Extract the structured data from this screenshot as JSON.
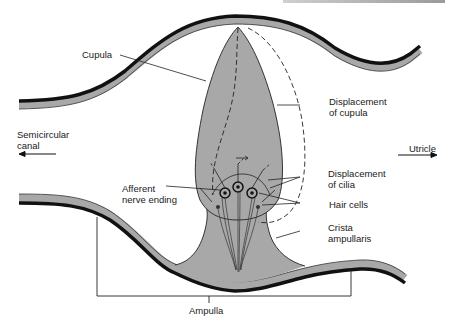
{
  "diagram": {
    "type": "anatomical-cross-section",
    "colors": {
      "tissue_fill": "#a8a8a8",
      "wall_dark": "#111111",
      "wall_light": "#a8a8a8",
      "line": "#1a1a1a",
      "background": "#ffffff"
    },
    "labels": {
      "cupula": "Cupula",
      "displacement_cupula_1": "Displacement",
      "displacement_cupula_2": "of cupula",
      "semicircular_canal_1": "Semicircular",
      "semicircular_canal_2": "canal",
      "utricle": "Utricle",
      "displacement_cilia_1": "Displacement",
      "displacement_cilia_2": "of cilia",
      "afferent_1": "Afferent",
      "afferent_2": "nerve ending",
      "hair_cells": "Hair cells",
      "crista_1": "Crista",
      "crista_2": "ampullaris",
      "ampulla": "Ampulla"
    },
    "direction_arrows": [
      {
        "label": "Semicircular canal",
        "direction": "left"
      },
      {
        "label": "Utricle",
        "direction": "right"
      }
    ]
  }
}
